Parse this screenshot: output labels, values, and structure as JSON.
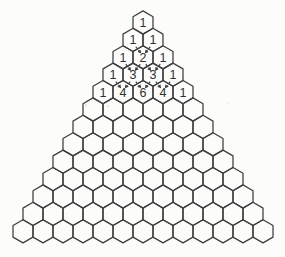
{
  "figure": {
    "name": "Pascal's triangle in hexagonal cells",
    "total_rows": 13,
    "rows_with_values": [
      [
        1
      ],
      [
        1,
        1
      ],
      [
        1,
        2,
        1
      ],
      [
        1,
        3,
        3,
        1
      ],
      [
        1,
        4,
        6,
        4,
        1
      ]
    ],
    "empty_row_count": 8,
    "arrow_rule": "dashed arrows point from each pair of adjacent cells into the interior cell below (sum rule)",
    "arrow_targets": [
      {
        "row": 3,
        "col": 1
      },
      {
        "row": 4,
        "col": 1
      },
      {
        "row": 4,
        "col": 2
      },
      {
        "row": 5,
        "col": 1
      },
      {
        "row": 5,
        "col": 2
      },
      {
        "row": 5,
        "col": 3
      }
    ],
    "colors": {
      "line": "#3e3e3e",
      "text": "#303030",
      "background": "#fcfcfb",
      "speckle": "#b9b9b4"
    }
  }
}
